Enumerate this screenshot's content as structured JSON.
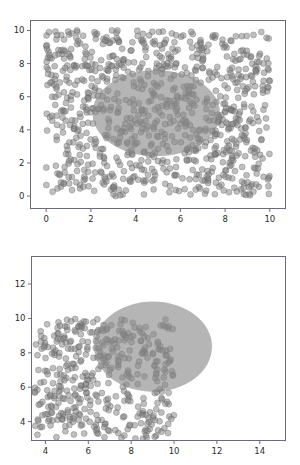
{
  "figure": {
    "background_color": "#ffffff",
    "panel_count": 2,
    "axes_color": "#6b6b7a",
    "tick_label_color": "#2b2b2b"
  },
  "chart_data": [
    {
      "type": "scatter",
      "panel": "top",
      "title": "",
      "xlabel": "",
      "ylabel": "",
      "xlim": [
        -0.7,
        10.7
      ],
      "ylim": [
        -0.75,
        10.6
      ],
      "xticks": [
        0,
        2,
        4,
        6,
        8,
        10
      ],
      "yticks": [
        0,
        2,
        4,
        6,
        8,
        10
      ],
      "xticklabels": [
        "0",
        "2",
        "4",
        "6",
        "8",
        "10"
      ],
      "yticklabels": [
        "0",
        "2",
        "4",
        "6",
        "8",
        "10"
      ],
      "grid": false,
      "legend": null,
      "series": [
        {
          "name": "uniform-scatter",
          "marker": "circle",
          "marker_size": 3.0,
          "color": "#808080",
          "edge_color": "#5a5a5a",
          "alpha": 0.5,
          "n_points": 900,
          "distribution": "uniform",
          "x_range": [
            0,
            10
          ],
          "y_range": [
            0,
            10
          ],
          "seed": 11
        }
      ],
      "annotations": [
        {
          "kind": "ellipse",
          "name": "confidence-ellipse",
          "center": [
            4.92,
            5.0
          ],
          "width": 5.7,
          "height": 5.2,
          "angle": 0,
          "fill_color": "#878787",
          "alpha": 0.62,
          "edge": "none"
        }
      ]
    },
    {
      "type": "scatter",
      "panel": "bottom",
      "title": "",
      "xlabel": "",
      "ylabel": "",
      "xlim": [
        3.35,
        15.2
      ],
      "ylim": [
        2.9,
        13.6
      ],
      "xticks": [
        4,
        6,
        8,
        10,
        12,
        14
      ],
      "yticks": [
        4,
        6,
        8,
        10,
        12
      ],
      "xticklabels": [
        "4",
        "6",
        "8",
        "10",
        "12",
        "14"
      ],
      "yticklabels": [
        "4",
        "6",
        "8",
        "10",
        "12"
      ],
      "grid": false,
      "legend": null,
      "series": [
        {
          "name": "uniform-scatter",
          "marker": "circle",
          "marker_size": 3.0,
          "color": "#808080",
          "edge_color": "#5a5a5a",
          "alpha": 0.5,
          "n_points": 430,
          "distribution": "uniform",
          "x_range": [
            3.5,
            10.0
          ],
          "y_range": [
            3.0,
            10.0
          ],
          "seed": 27
        }
      ],
      "annotations": [
        {
          "kind": "ellipse",
          "name": "confidence-ellipse",
          "center": [
            9.02,
            8.36
          ],
          "width": 5.5,
          "height": 5.25,
          "angle": 0,
          "fill_color": "#878787",
          "alpha": 0.62,
          "edge": "none"
        }
      ]
    }
  ]
}
